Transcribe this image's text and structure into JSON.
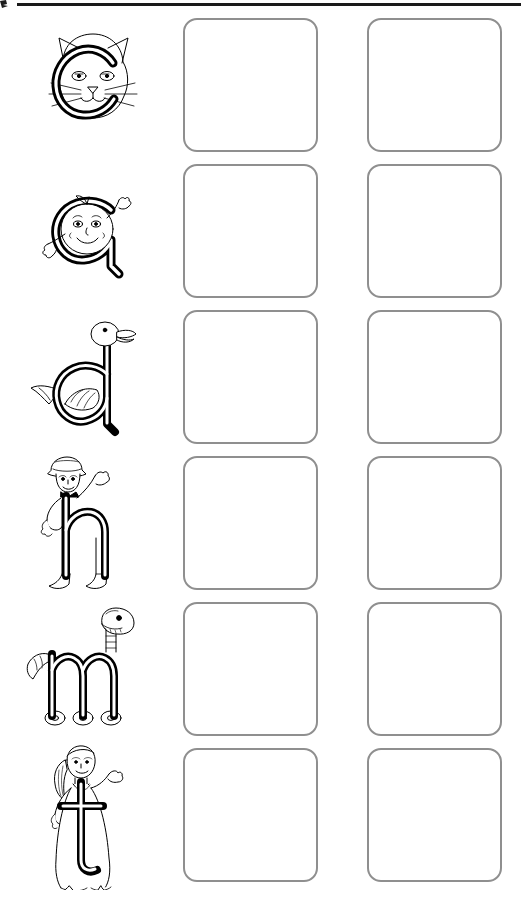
{
  "page": {
    "background_color": "#ffffff",
    "width": 521,
    "height": 907,
    "top_rule_color": "#1a1a1a",
    "box_border_color": "#8f8f8f",
    "ink_color": "#000000"
  },
  "worksheet": {
    "columns": 2,
    "rows": [
      {
        "letter": "c",
        "letter_case": "lowercase",
        "illustration": "cat-letter-c",
        "illustration_description": "lowercase c drawn as a cat face with ears and whiskers",
        "boxes": [
          "",
          ""
        ]
      },
      {
        "letter": "a",
        "letter_case": "lowercase",
        "illustration": "apple-face-letter-a",
        "illustration_description": "lowercase a drawn as a round smiling apple character with arms",
        "boxes": [
          "",
          ""
        ]
      },
      {
        "letter": "d",
        "letter_case": "lowercase",
        "illustration": "duck-letter-d",
        "illustration_description": "lowercase d drawn as a duck with head on the stem, wing and tail",
        "boxes": [
          "",
          ""
        ]
      },
      {
        "letter": "h",
        "letter_case": "lowercase",
        "illustration": "hat-man-letter-h",
        "illustration_description": "lowercase h drawn as a person wearing a hat waving one arm",
        "boxes": [
          "",
          ""
        ]
      },
      {
        "letter": "m",
        "letter_case": "lowercase",
        "illustration": "monster-letter-m",
        "illustration_description": "lowercase m drawn as a long-necked monster on wheels",
        "boxes": [
          "",
          ""
        ]
      },
      {
        "letter": "t",
        "letter_case": "lowercase",
        "illustration": "tall-girl-letter-t",
        "illustration_description": "lowercase t drawn with a tall girl figure standing behind it",
        "boxes": [
          "",
          ""
        ]
      }
    ]
  }
}
